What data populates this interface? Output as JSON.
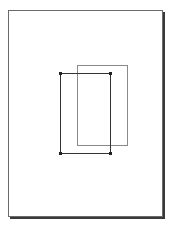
{
  "canvas": {
    "width": 170,
    "height": 226,
    "background": "#ffffff"
  },
  "page": {
    "x": 8,
    "y": 10,
    "width": 154,
    "height": 206,
    "border_color": "#6a6a6a",
    "shadow_color": "#3a3a3a"
  },
  "shapes": [
    {
      "name": "back-rectangle",
      "x": 77,
      "y": 65,
      "width": 51,
      "height": 81,
      "stroke": "#8a8a8a",
      "selected": false
    },
    {
      "name": "front-rectangle",
      "x": 60,
      "y": 73,
      "width": 51,
      "height": 81,
      "stroke": "#333333",
      "selected": true
    }
  ]
}
